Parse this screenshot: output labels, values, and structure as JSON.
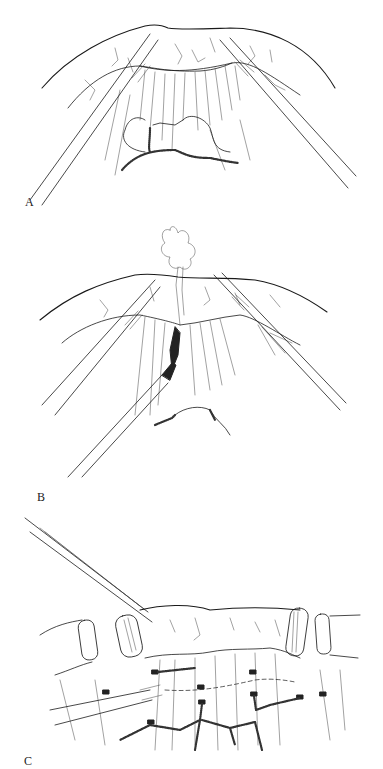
{
  "figure": {
    "panels": [
      {
        "id": "A",
        "label": "A",
        "content": "Colon segment elevated by two graspers, mesentery with vessels and arcades exposed"
      },
      {
        "id": "B",
        "label": "B",
        "content": "Third instrument dissecting mesentery window; tissue specimen pulled upward"
      },
      {
        "id": "C",
        "label": "C",
        "content": "Stapled bowel segments with clipped mesenteric vessels, grasper and stapler instruments"
      }
    ]
  },
  "colors": {
    "background": "#ffffff",
    "ink": "#1a1a1a"
  }
}
